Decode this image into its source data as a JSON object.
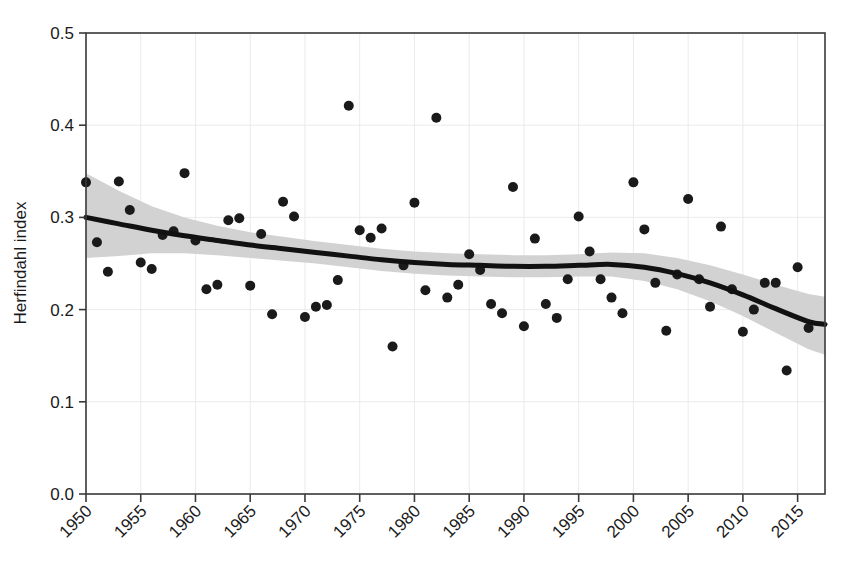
{
  "chart_data": {
    "type": "scatter",
    "title": "",
    "xlabel": "",
    "ylabel": "Herfindahl index",
    "xlim": [
      1950,
      2017.5
    ],
    "ylim": [
      0.0,
      0.5
    ],
    "grid": true,
    "legend": false,
    "xticks": [
      1950,
      1955,
      1960,
      1965,
      1970,
      1975,
      1980,
      1985,
      1990,
      1995,
      2000,
      2005,
      2010,
      2015
    ],
    "xtick_labels": [
      "1950",
      "1955",
      "1960",
      "1965",
      "1970",
      "1975",
      "1980",
      "1985",
      "1990",
      "1995",
      "2000",
      "2005",
      "2010",
      "2015"
    ],
    "xtick_rotation": 45,
    "yticks": [
      0.0,
      0.1,
      0.2,
      0.3,
      0.4,
      0.5
    ],
    "ytick_labels": [
      "0.0",
      "0.1",
      "0.2",
      "0.3",
      "0.4",
      "0.5"
    ],
    "point_color": "#1a1a1a",
    "point_radius_px": 5,
    "fit_line_color": "#111111",
    "fit_line_width_px": 5,
    "band_color": "#d2d2d2",
    "band_label": "confidence band",
    "fit_label": "loess smooth",
    "x": [
      1950,
      1951,
      1952,
      1953,
      1954,
      1955,
      1956,
      1957,
      1958,
      1959,
      1960,
      1961,
      1962,
      1963,
      1964,
      1965,
      1966,
      1967,
      1968,
      1969,
      1970,
      1971,
      1972,
      1973,
      1974,
      1975,
      1976,
      1977,
      1978,
      1979,
      1980,
      1981,
      1982,
      1983,
      1984,
      1985,
      1986,
      1987,
      1988,
      1989,
      1990,
      1991,
      1992,
      1993,
      1994,
      1995,
      1996,
      1997,
      1998,
      1999,
      2000,
      2001,
      2002,
      2003,
      2004,
      2005,
      2006,
      2007,
      2008,
      2009,
      2010,
      2011,
      2012,
      2013,
      2014,
      2015,
      2016
    ],
    "y": [
      0.338,
      0.273,
      0.241,
      0.339,
      0.308,
      0.251,
      0.244,
      0.281,
      0.285,
      0.348,
      0.275,
      0.222,
      0.227,
      0.297,
      0.299,
      0.226,
      0.282,
      0.195,
      0.317,
      0.301,
      0.192,
      0.203,
      0.205,
      0.232,
      0.421,
      0.286,
      0.278,
      0.288,
      0.16,
      0.248,
      0.316,
      0.221,
      0.408,
      0.213,
      0.227,
      0.26,
      0.243,
      0.206,
      0.196,
      0.333,
      0.182,
      0.277,
      0.206,
      0.191,
      0.233,
      0.301,
      0.263,
      0.233,
      0.213,
      0.196,
      0.338,
      0.287,
      0.229,
      0.177,
      0.238,
      0.32,
      0.233,
      0.203,
      0.29,
      0.222,
      0.176,
      0.2,
      0.229,
      0.229,
      0.134,
      0.246,
      0.18
    ],
    "fit_x": [
      1950,
      1953,
      1956,
      1959,
      1962,
      1965,
      1968,
      1971,
      1974,
      1977,
      1980,
      1983,
      1986,
      1989,
      1992,
      1995,
      1998,
      2001,
      2004,
      2007,
      2010,
      2013,
      2016,
      2017.5
    ],
    "fit_y": [
      0.3,
      0.293,
      0.286,
      0.28,
      0.275,
      0.27,
      0.266,
      0.262,
      0.258,
      0.254,
      0.251,
      0.249,
      0.248,
      0.247,
      0.247,
      0.248,
      0.249,
      0.246,
      0.239,
      0.229,
      0.216,
      0.201,
      0.187,
      0.184
    ],
    "band_upper": [
      0.348,
      0.329,
      0.312,
      0.3,
      0.291,
      0.284,
      0.279,
      0.274,
      0.27,
      0.266,
      0.263,
      0.261,
      0.26,
      0.259,
      0.259,
      0.26,
      0.262,
      0.261,
      0.256,
      0.248,
      0.238,
      0.227,
      0.217,
      0.214
    ],
    "band_lower": [
      0.256,
      0.258,
      0.261,
      0.261,
      0.259,
      0.256,
      0.253,
      0.25,
      0.246,
      0.242,
      0.239,
      0.237,
      0.236,
      0.235,
      0.235,
      0.236,
      0.236,
      0.231,
      0.222,
      0.209,
      0.193,
      0.175,
      0.157,
      0.151
    ]
  }
}
